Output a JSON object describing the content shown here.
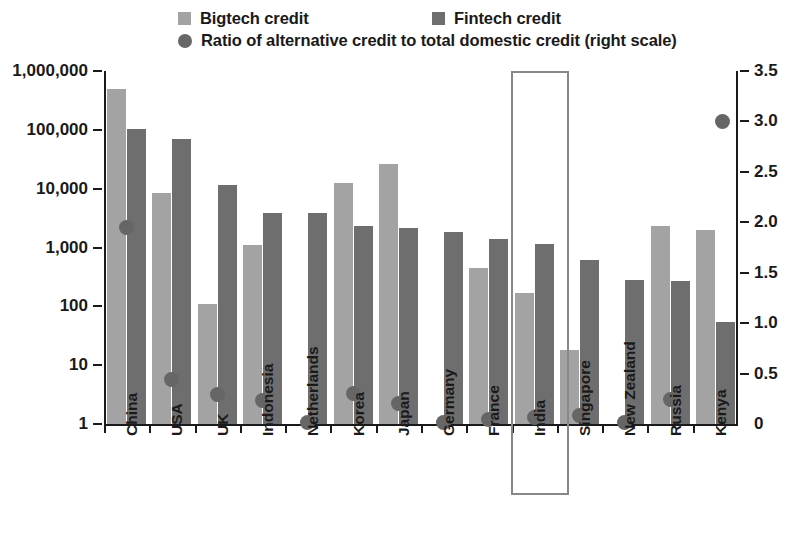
{
  "legend": {
    "bigtech": {
      "label": "Bigtech credit",
      "color": "#a3a3a3",
      "icon": "square-swatch-icon"
    },
    "fintech": {
      "label": "Fintech credit",
      "color": "#6e6e6e",
      "icon": "square-swatch-icon"
    },
    "ratio": {
      "label": "Ratio of alternative credit to total domestic credit (right scale)",
      "color": "#666666",
      "icon": "circle-marker-icon"
    }
  },
  "highlight": {
    "category": "India",
    "color": "#888888"
  },
  "chart_data": {
    "type": "bar",
    "title": "",
    "subtitle": "",
    "xlabel": "",
    "ylabel": "",
    "y2label": "",
    "grid": false,
    "legend_position": "top",
    "yscale": "log",
    "ylim": [
      1,
      1000000
    ],
    "ytick_labels": [
      "1,000,000",
      "100,000",
      "10,000",
      "1,000",
      "100",
      "10",
      "1"
    ],
    "ytick_values": [
      1000000,
      100000,
      10000,
      1000,
      100,
      10,
      1
    ],
    "y2scale": "linear",
    "y2lim": [
      0,
      3.5
    ],
    "y2tick_labels": [
      "3.5",
      "3.0",
      "2.5",
      "2.0",
      "1.5",
      "1.0",
      "0.5",
      "0"
    ],
    "y2tick_values": [
      3.5,
      3.0,
      2.5,
      2.0,
      1.5,
      1.0,
      0.5,
      0
    ],
    "categories": [
      "China",
      "USA",
      "UK",
      "Indonesia",
      "Netherlands",
      "Korea",
      "Japan",
      "Germany",
      "France",
      "India",
      "Singapore",
      "New Zealand",
      "Russia",
      "Kenya"
    ],
    "series": [
      {
        "name": "Bigtech credit",
        "type": "bar",
        "axis": "left",
        "color": "#a3a3a3",
        "values": [
          500000,
          8500,
          110,
          1100,
          null,
          12500,
          26000,
          null,
          450,
          170,
          18,
          null,
          2300,
          2000
        ]
      },
      {
        "name": "Fintech credit",
        "type": "bar",
        "axis": "left",
        "color": "#6e6e6e",
        "values": [
          105000,
          70000,
          11500,
          3900,
          3800,
          2300,
          2150,
          1800,
          1400,
          1150,
          620,
          280,
          270,
          55
        ]
      },
      {
        "name": "Ratio of alternative credit to total domestic credit (right scale)",
        "type": "scatter",
        "axis": "right",
        "color": "#666666",
        "values": [
          1.95,
          0.45,
          0.3,
          0.24,
          0.02,
          0.31,
          0.21,
          0.02,
          0.05,
          0.07,
          0.09,
          0.02,
          0.25,
          null
        ]
      }
    ],
    "stray_marker": {
      "value": 3.0,
      "axis": "right",
      "color": "#666666"
    }
  }
}
